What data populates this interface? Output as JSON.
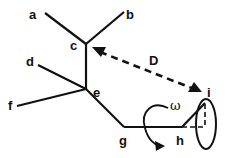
{
  "diagram": {
    "nodes": [
      {
        "id": "a",
        "label": "a"
      },
      {
        "id": "b",
        "label": "b"
      },
      {
        "id": "c",
        "label": "c"
      },
      {
        "id": "d",
        "label": "d"
      },
      {
        "id": "e",
        "label": "e"
      },
      {
        "id": "f",
        "label": "f"
      },
      {
        "id": "g",
        "label": "g"
      },
      {
        "id": "h",
        "label": "h"
      },
      {
        "id": "i",
        "label": "i"
      }
    ],
    "edges": [
      {
        "from": "a",
        "to": "c",
        "style": "solid"
      },
      {
        "from": "b",
        "to": "c",
        "style": "solid"
      },
      {
        "from": "c",
        "to": "e",
        "style": "solid"
      },
      {
        "from": "d",
        "to": "e",
        "style": "solid"
      },
      {
        "from": "f",
        "to": "e",
        "style": "solid"
      },
      {
        "from": "e",
        "to": "g",
        "style": "solid"
      },
      {
        "from": "g",
        "to": "h",
        "style": "solid"
      },
      {
        "from": "h",
        "to": "i",
        "style": "solid"
      }
    ],
    "distance": {
      "label": "D",
      "from": "c",
      "to": "i",
      "style": "dashed-double-arrow"
    },
    "rotation": {
      "label": "ω",
      "axis": "g-h"
    },
    "cone": {
      "apex": "h",
      "tip": "i"
    }
  }
}
